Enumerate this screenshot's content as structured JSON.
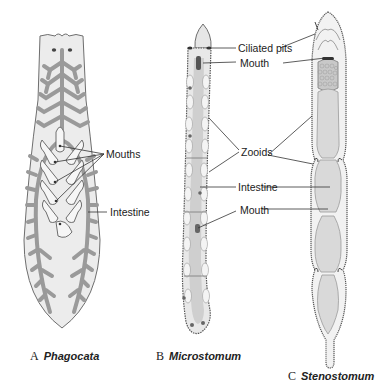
{
  "figure": {
    "panels": [
      {
        "letter": "A",
        "genus": "Phagocata",
        "labels": {
          "mouths": "Mouths",
          "intestine": "Intestine"
        }
      },
      {
        "letter": "B",
        "genus": "Microstomum",
        "labels": {}
      },
      {
        "letter": "C",
        "genus": "Stenostomum",
        "labels": {}
      }
    ],
    "shared_labels": {
      "ciliated_pits": "Ciliated pits",
      "mouth_top": "Mouth",
      "zooids": "Zooids",
      "intestine": "Intestine",
      "mouth_bottom": "Mouth"
    },
    "colors": {
      "body_fill": "#ececec",
      "body_outline": "#6e6e6e",
      "gut_gray": "#9a9a9a",
      "leader_line": "#333333",
      "text": "#222222"
    }
  }
}
